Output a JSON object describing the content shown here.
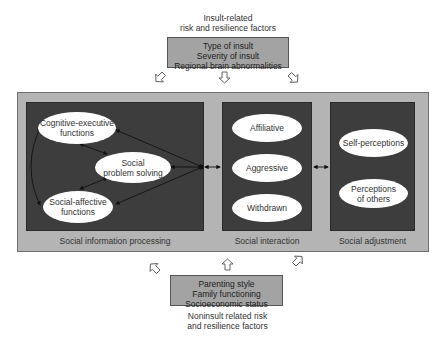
{
  "top_factors": {
    "caption": [
      "Insult-related",
      "risk and resilience factors"
    ],
    "items": [
      "Type of insult",
      "Severity of insult",
      "Regional brain abnormalities"
    ]
  },
  "bottom_factors": {
    "caption": [
      "Noninsult related risk",
      "and resilience factors"
    ],
    "items": [
      "Parenting style",
      "Family functioning",
      "Socioeconomic status"
    ]
  },
  "panels": {
    "social_information_processing": {
      "label": "Social information processing",
      "nodes": [
        {
          "lines": [
            "Cognitive-executive",
            "functions"
          ]
        },
        {
          "lines": [
            "Social",
            "problem solving"
          ]
        },
        {
          "lines": [
            "Social-affective",
            "functions"
          ]
        }
      ]
    },
    "social_interaction": {
      "label": "Social interaction",
      "nodes": [
        {
          "lines": [
            "Affiliative"
          ]
        },
        {
          "lines": [
            "Aggressive"
          ]
        },
        {
          "lines": [
            "Withdrawn"
          ]
        }
      ]
    },
    "social_adjustment": {
      "label": "Social adjustment",
      "nodes": [
        {
          "lines": [
            "Self-perceptions"
          ]
        },
        {
          "lines": [
            "Perceptions",
            "of others"
          ]
        }
      ]
    }
  },
  "colors": {
    "outer_box": "#b4b4b4",
    "panel": "#3d3d3d",
    "factor_box": "#a3a3a3",
    "node": "#ffffff"
  }
}
